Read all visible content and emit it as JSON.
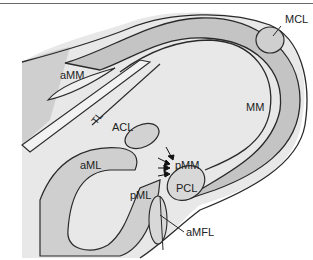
{
  "diagram": {
    "colors": {
      "line": "#2a2a2a",
      "meniscus_fill": "#c9c9c9",
      "plateau_fill": "#e6e6e6",
      "ligament_fill": "#d2d2d2",
      "background": "#ffffff"
    },
    "labels": {
      "mcl": "MCL",
      "amm": "aMM",
      "mm": "MM",
      "tl": "TL",
      "acl": "ACL",
      "aml": "aML",
      "pmm": "pMM",
      "pml": "pML",
      "pcl": "PCL",
      "amfl": "aMFL"
    }
  }
}
